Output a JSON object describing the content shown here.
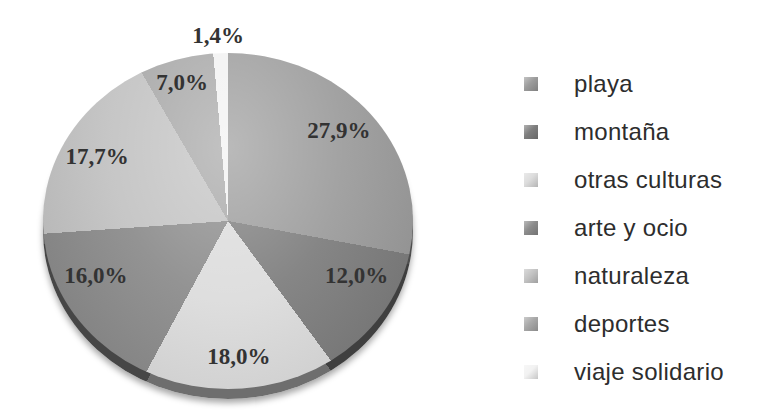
{
  "chart_data": {
    "type": "pie",
    "title": "",
    "start_angle_deg": 0,
    "direction": "clockwise",
    "legend_position": "right",
    "value_suffix": "%",
    "decimal_separator": ",",
    "total": 100,
    "slices": [
      {
        "label": "playa",
        "value": 27.9,
        "display": "27,9%",
        "color": "#9c9c9c"
      },
      {
        "label": "montaña",
        "value": 12.0,
        "display": "12,0%",
        "color": "#7e7e7e"
      },
      {
        "label": "otras culturas",
        "value": 18.0,
        "display": "18,0%",
        "color": "#dcdcdc"
      },
      {
        "label": "arte y ocio",
        "value": 16.0,
        "display": "16,0%",
        "color": "#8c8c8c"
      },
      {
        "label": "naturaleza",
        "value": 17.7,
        "display": "17,7%",
        "color": "#c3c3c3"
      },
      {
        "label": "deportes",
        "value": 7.0,
        "display": "7,0%",
        "color": "#a8a8a8"
      },
      {
        "label": "viaje solidario",
        "value": 1.4,
        "display": "1,4%",
        "color": "#f2f2f2",
        "label_outside": true
      }
    ]
  }
}
